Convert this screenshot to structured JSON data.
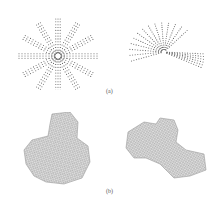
{
  "figure": {
    "row_a": {
      "label": "(a)",
      "panels": [
        {
          "name": "point-cloud-left",
          "description": "radial star-like 3D point cloud"
        },
        {
          "name": "point-cloud-right",
          "description": "fan-shaped 3D point cloud"
        }
      ]
    },
    "row_b": {
      "label": "(b)",
      "panels": [
        {
          "name": "mesh-left",
          "description": "wireframe mesh surface, lobed shape"
        },
        {
          "name": "mesh-right",
          "description": "wireframe mesh surface, elongated shape"
        }
      ]
    },
    "colors": {
      "point": "#6a6a6a",
      "mesh_fill": "#d9d9d9",
      "mesh_line": "#8a8a8a",
      "label": "#555555"
    }
  }
}
